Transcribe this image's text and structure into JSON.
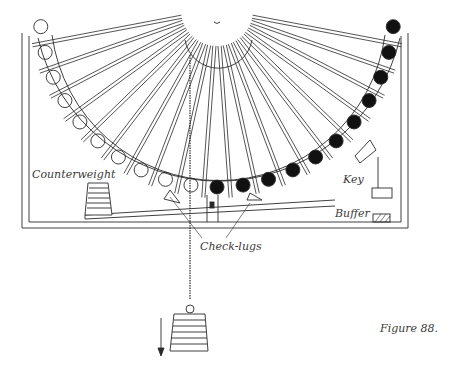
{
  "figure": {
    "caption": "Figure 88.",
    "labels": {
      "counterweight": "Counterweight",
      "key": "Key",
      "buffer": "Buffer",
      "check_lugs": "Check-lugs"
    },
    "wheel": {
      "spokes": 20,
      "empty_sockets": 10,
      "ball_sockets": 11
    },
    "colors": {
      "ink": "#2a2a2a",
      "paper": "#ffffff",
      "ball": "#111111"
    }
  }
}
